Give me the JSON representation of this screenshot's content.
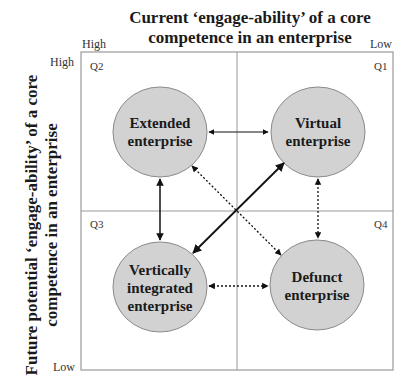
{
  "title": {
    "line1": "Current ‘engage-ability’ of a core",
    "line2": "competence in an enterprise"
  },
  "y_axis_label": {
    "line1": "Future potential ‘engage-ability’ of a core",
    "line2": "competence in an enterprise"
  },
  "x_ticks": {
    "left": "High",
    "right": "Low"
  },
  "y_ticks": {
    "top": "High",
    "bottom": "Low"
  },
  "quadrants": [
    {
      "id": "Q2",
      "label": "Q2"
    },
    {
      "id": "Q1",
      "label": "Q1"
    },
    {
      "id": "Q3",
      "label": "Q3"
    },
    {
      "id": "Q4",
      "label": "Q4"
    }
  ],
  "nodes": [
    {
      "id": "extended",
      "quadrant": "Q2",
      "lines": [
        "Extended",
        "enterprise"
      ]
    },
    {
      "id": "virtual",
      "quadrant": "Q1",
      "lines": [
        "Virtual",
        "enterprise"
      ]
    },
    {
      "id": "vertical",
      "quadrant": "Q3",
      "lines": [
        "Vertically",
        "integrated",
        "enterprise"
      ]
    },
    {
      "id": "defunct",
      "quadrant": "Q4",
      "lines": [
        "Defunct",
        "enterprise"
      ]
    }
  ],
  "edges": [
    {
      "from": "extended",
      "to": "virtual",
      "style": "solid",
      "direction": "both"
    },
    {
      "from": "extended",
      "to": "vertical",
      "style": "solid",
      "direction": "both"
    },
    {
      "from": "vertical",
      "to": "virtual",
      "style": "solid-bold",
      "direction": "both"
    },
    {
      "from": "extended",
      "to": "defunct",
      "style": "dotted",
      "direction": "both"
    },
    {
      "from": "virtual",
      "to": "defunct",
      "style": "dotted",
      "direction": "both"
    },
    {
      "from": "vertical",
      "to": "defunct",
      "style": "dotted",
      "direction": "both"
    }
  ],
  "colors": {
    "circle_fill": "#d2d2d2",
    "circle_stroke": "#8a8a8a",
    "grid": "#9a9a9a",
    "arrow": "#111111"
  }
}
